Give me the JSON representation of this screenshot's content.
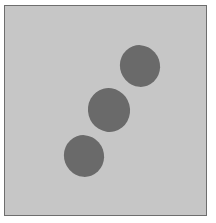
{
  "figure": {
    "background_color": "#c6c6c6",
    "border_color": "#6e6e6e",
    "shape_color": "#6a6a6a",
    "shapes": [
      {
        "name": "top-right-ellipse",
        "cx": 140,
        "cy": 66,
        "rx": 20,
        "ry": 21,
        "rotate": -20
      },
      {
        "name": "middle-ellipse",
        "cx": 109,
        "cy": 110,
        "rx": 21,
        "ry": 22,
        "rotate": -15
      },
      {
        "name": "bottom-left-ellipse",
        "cx": 84,
        "cy": 156,
        "rx": 20,
        "ry": 21,
        "rotate": -20
      }
    ]
  }
}
